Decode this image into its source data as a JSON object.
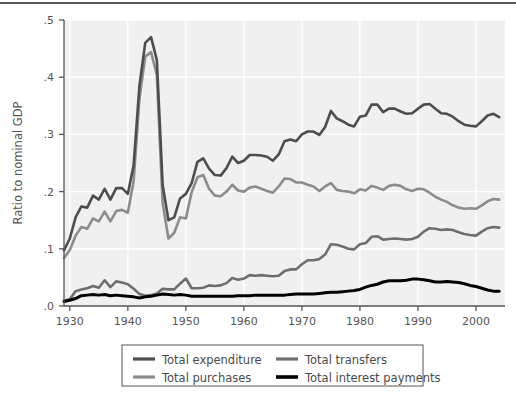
{
  "chart_data": {
    "type": "line",
    "title": "",
    "xlabel": "",
    "ylabel": "Ratio to nominal GDP",
    "xlim": [
      1929,
      2005
    ],
    "ylim": [
      0.0,
      0.5
    ],
    "grid": true,
    "legend_position": "bottom-center",
    "x_ticks": [
      1930,
      1940,
      1950,
      1960,
      1970,
      1980,
      1990,
      2000
    ],
    "x_tick_labels": [
      "1930",
      "1940",
      "1950",
      "1960",
      "1970",
      "1980",
      "1990",
      "2000"
    ],
    "y_ticks": [
      0.0,
      0.1,
      0.2,
      0.3,
      0.4,
      0.5
    ],
    "y_tick_labels": [
      ".0",
      ".1",
      ".2",
      ".3",
      ".4",
      ".5"
    ],
    "x": [
      1929,
      1930,
      1931,
      1932,
      1933,
      1934,
      1935,
      1936,
      1937,
      1938,
      1939,
      1940,
      1941,
      1942,
      1943,
      1944,
      1945,
      1946,
      1947,
      1948,
      1949,
      1950,
      1951,
      1952,
      1953,
      1954,
      1955,
      1956,
      1957,
      1958,
      1959,
      1960,
      1961,
      1962,
      1963,
      1964,
      1965,
      1966,
      1967,
      1968,
      1969,
      1970,
      1971,
      1972,
      1973,
      1974,
      1975,
      1976,
      1977,
      1978,
      1979,
      1980,
      1981,
      1982,
      1983,
      1984,
      1985,
      1986,
      1987,
      1988,
      1989,
      1990,
      1991,
      1992,
      1993,
      1994,
      1995,
      1996,
      1997,
      1998,
      1999,
      2000,
      2001,
      2002,
      2003,
      2004
    ],
    "series": [
      {
        "name": "Total expenditure",
        "color": "#4d4d4d",
        "width": 2.6,
        "values": [
          0.097,
          0.118,
          0.155,
          0.174,
          0.172,
          0.193,
          0.186,
          0.205,
          0.186,
          0.206,
          0.206,
          0.196,
          0.246,
          0.385,
          0.46,
          0.47,
          0.43,
          0.212,
          0.15,
          0.155,
          0.188,
          0.196,
          0.215,
          0.252,
          0.258,
          0.24,
          0.229,
          0.228,
          0.241,
          0.261,
          0.25,
          0.254,
          0.264,
          0.264,
          0.263,
          0.261,
          0.254,
          0.265,
          0.288,
          0.291,
          0.288,
          0.3,
          0.305,
          0.305,
          0.299,
          0.313,
          0.341,
          0.328,
          0.323,
          0.317,
          0.314,
          0.331,
          0.333,
          0.352,
          0.352,
          0.339,
          0.345,
          0.345,
          0.34,
          0.336,
          0.337,
          0.345,
          0.352,
          0.353,
          0.345,
          0.337,
          0.336,
          0.331,
          0.323,
          0.317,
          0.315,
          0.314,
          0.323,
          0.333,
          0.336,
          0.33
        ]
      },
      {
        "name": "Total purchases",
        "color": "#8c8c8c",
        "width": 2.6,
        "values": [
          0.084,
          0.098,
          0.123,
          0.138,
          0.135,
          0.153,
          0.148,
          0.165,
          0.148,
          0.166,
          0.168,
          0.163,
          0.218,
          0.362,
          0.436,
          0.444,
          0.404,
          0.18,
          0.118,
          0.128,
          0.155,
          0.153,
          0.199,
          0.225,
          0.229,
          0.205,
          0.193,
          0.192,
          0.2,
          0.212,
          0.202,
          0.2,
          0.207,
          0.209,
          0.205,
          0.201,
          0.198,
          0.209,
          0.223,
          0.222,
          0.216,
          0.216,
          0.212,
          0.209,
          0.201,
          0.209,
          0.215,
          0.203,
          0.201,
          0.2,
          0.197,
          0.204,
          0.202,
          0.21,
          0.207,
          0.203,
          0.21,
          0.212,
          0.21,
          0.204,
          0.201,
          0.205,
          0.204,
          0.198,
          0.191,
          0.186,
          0.182,
          0.176,
          0.172,
          0.17,
          0.171,
          0.17,
          0.176,
          0.183,
          0.187,
          0.186
        ]
      },
      {
        "name": "Total transfers",
        "color": "#6e6e6e",
        "width": 2.6,
        "values": [
          0.009,
          0.012,
          0.026,
          0.029,
          0.031,
          0.035,
          0.032,
          0.045,
          0.033,
          0.043,
          0.041,
          0.038,
          0.03,
          0.021,
          0.018,
          0.019,
          0.022,
          0.03,
          0.029,
          0.029,
          0.039,
          0.048,
          0.031,
          0.031,
          0.032,
          0.036,
          0.035,
          0.036,
          0.04,
          0.049,
          0.046,
          0.048,
          0.054,
          0.053,
          0.054,
          0.053,
          0.052,
          0.053,
          0.061,
          0.064,
          0.064,
          0.073,
          0.08,
          0.08,
          0.082,
          0.09,
          0.108,
          0.107,
          0.104,
          0.1,
          0.099,
          0.108,
          0.11,
          0.121,
          0.122,
          0.116,
          0.117,
          0.118,
          0.117,
          0.116,
          0.117,
          0.121,
          0.13,
          0.136,
          0.135,
          0.133,
          0.134,
          0.133,
          0.129,
          0.126,
          0.124,
          0.123,
          0.13,
          0.136,
          0.138,
          0.137
        ]
      },
      {
        "name": "Total interest payments",
        "color": "#000000",
        "width": 3.0,
        "values": [
          0.008,
          0.01,
          0.013,
          0.018,
          0.019,
          0.02,
          0.019,
          0.02,
          0.018,
          0.019,
          0.018,
          0.017,
          0.016,
          0.014,
          0.016,
          0.017,
          0.019,
          0.021,
          0.02,
          0.019,
          0.02,
          0.019,
          0.017,
          0.017,
          0.017,
          0.017,
          0.017,
          0.017,
          0.017,
          0.017,
          0.018,
          0.018,
          0.018,
          0.019,
          0.019,
          0.019,
          0.019,
          0.019,
          0.019,
          0.02,
          0.021,
          0.021,
          0.021,
          0.021,
          0.022,
          0.023,
          0.024,
          0.024,
          0.025,
          0.026,
          0.027,
          0.029,
          0.033,
          0.036,
          0.038,
          0.042,
          0.044,
          0.044,
          0.044,
          0.045,
          0.047,
          0.047,
          0.046,
          0.044,
          0.042,
          0.042,
          0.043,
          0.042,
          0.041,
          0.039,
          0.036,
          0.034,
          0.031,
          0.028,
          0.026,
          0.026
        ]
      }
    ],
    "legend": [
      {
        "label": "Total expenditure",
        "color": "#4d4d4d"
      },
      {
        "label": "Total purchases",
        "color": "#8c8c8c"
      },
      {
        "label": "Total transfers",
        "color": "#6e6e6e"
      },
      {
        "label": "Total interest payments",
        "color": "#000000"
      }
    ],
    "colors": {
      "plot_background": "#f0f0f0",
      "gridline": "#ffffff",
      "axis": "#555555",
      "page_background": "#ffffff",
      "top_rule": "#5a5a5a"
    }
  }
}
